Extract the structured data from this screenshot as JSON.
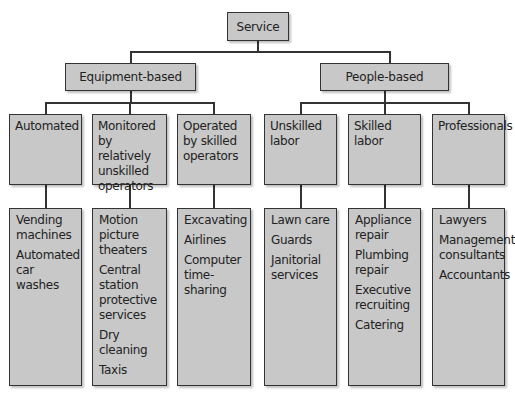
{
  "root": {
    "label": "Service"
  },
  "branches": [
    {
      "label": "Equipment-based",
      "categories": [
        {
          "label": "Automated",
          "examples": [
            "Vending machines",
            "Automated car washes"
          ]
        },
        {
          "label": "Monitored by relatively unskilled operators",
          "examples": [
            "Motion picture theaters",
            "Central station protective services",
            "Dry cleaning",
            "Taxis"
          ]
        },
        {
          "label": "Operated by skilled operators",
          "examples": [
            "Excavating",
            "Airlines",
            "Computer time-sharing"
          ]
        }
      ]
    },
    {
      "label": "People-based",
      "categories": [
        {
          "label": "Unskilled labor",
          "examples": [
            "Lawn care",
            "Guards",
            "Janitorial services"
          ]
        },
        {
          "label": "Skilled labor",
          "examples": [
            "Appliance repair",
            "Plumbing repair",
            "Executive recruiting",
            "Catering"
          ]
        },
        {
          "label": "Professionals",
          "examples": [
            "Lawyers",
            "Management consultants",
            "Accountants"
          ]
        }
      ]
    }
  ],
  "colors": {
    "box_fill": "#c8c8c8",
    "border": "#333333",
    "background": "#ffffff"
  }
}
